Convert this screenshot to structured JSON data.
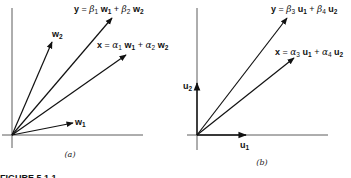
{
  "figure": {
    "caption": "FIGURE 5.1.1",
    "panels": [
      {
        "id": "a",
        "label": "(a)",
        "vectors": [
          {
            "name": "w1",
            "text": "w",
            "sub": "1"
          },
          {
            "name": "w2",
            "text": "w",
            "sub": "2"
          },
          {
            "name": "y",
            "equation": {
              "lhs": "y",
              "c1": "β",
              "c1sub": "1",
              "b1": "w",
              "b1sub": "1",
              "c2": "β",
              "c2sub": "2",
              "b2": "w",
              "b2sub": "2"
            }
          },
          {
            "name": "x",
            "equation": {
              "lhs": "x",
              "c1": "α",
              "c1sub": "1",
              "b1": "w",
              "b1sub": "1",
              "c2": "α",
              "c2sub": "2",
              "b2": "w",
              "b2sub": "2"
            }
          }
        ]
      },
      {
        "id": "b",
        "label": "(b)",
        "vectors": [
          {
            "name": "u1",
            "text": "u",
            "sub": "1"
          },
          {
            "name": "u2",
            "text": "u",
            "sub": "2"
          },
          {
            "name": "y",
            "equation": {
              "lhs": "y",
              "c1": "β",
              "c1sub": "3",
              "b1": "u",
              "b1sub": "1",
              "c2": "β",
              "c2sub": "4",
              "b2": "u",
              "b2sub": "2"
            }
          },
          {
            "name": "x",
            "equation": {
              "lhs": "x",
              "c1": "α",
              "c1sub": "3",
              "b1": "u",
              "b1sub": "1",
              "c2": "α",
              "c2sub": "4",
              "b2": "u",
              "b2sub": "2"
            }
          }
        ]
      }
    ],
    "symbols": {
      "eq": " = ",
      "plus": " + "
    }
  }
}
